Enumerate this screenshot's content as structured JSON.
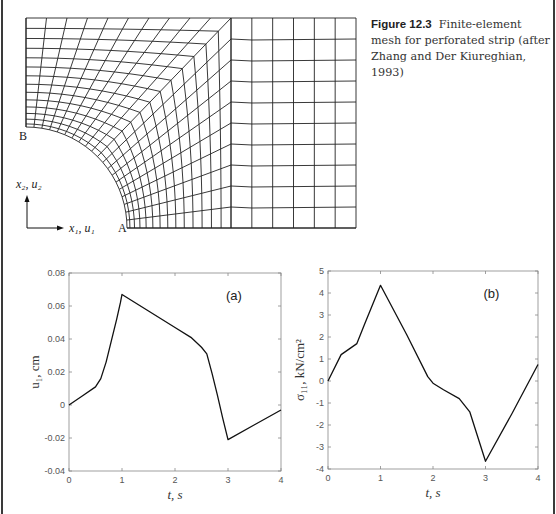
{
  "figure": {
    "label": "Figure 12.3",
    "caption": "Finite-element mesh for perforated strip (after Zhang and Der Kiureghian, 1993)"
  },
  "mesh": {
    "point_b_label": "B",
    "point_a_label": "A",
    "axis_vertical_label": "x₂, u₂",
    "axis_horizontal_label": "x₁, u₁",
    "line_color": "#222222"
  },
  "chart_data": [
    {
      "type": "line",
      "panel_label": "(a)",
      "title": "",
      "xlabel": "t, s",
      "ylabel": "u₁, cm",
      "xlim": [
        0,
        4
      ],
      "ylim": [
        -0.04,
        0.08
      ],
      "xticks": [
        "0",
        "1",
        "2",
        "3",
        "4"
      ],
      "yticks": [
        "-0.04",
        "-0.02",
        "0",
        "0.02",
        "0.04",
        "0.06",
        "0.08"
      ],
      "grid": false,
      "x": [
        0,
        0.25,
        0.5,
        0.6,
        0.7,
        0.8,
        0.9,
        0.97,
        1.0,
        1.5,
        2.0,
        2.3,
        2.5,
        2.6,
        2.7,
        2.8,
        2.9,
        3.0,
        3.5,
        4.0
      ],
      "y": [
        0,
        0.0055,
        0.011,
        0.016,
        0.026,
        0.039,
        0.052,
        0.062,
        0.067,
        0.057,
        0.047,
        0.041,
        0.035,
        0.031,
        0.019,
        0.006,
        -0.008,
        -0.021,
        -0.012,
        -0.003
      ]
    },
    {
      "type": "line",
      "panel_label": "(b)",
      "title": "",
      "xlabel": "t, s",
      "ylabel": "σ₁₁, kN/cm²",
      "xlim": [
        0,
        4
      ],
      "ylim": [
        -4,
        5
      ],
      "xticks": [
        "0",
        "1",
        "2",
        "3",
        "4"
      ],
      "yticks": [
        "-4",
        "-3",
        "-2",
        "-1",
        "0",
        "1",
        "2",
        "3",
        "4",
        "5"
      ],
      "grid": false,
      "x": [
        0,
        0.25,
        0.4,
        0.55,
        0.7,
        1.0,
        1.5,
        1.9,
        2.0,
        2.2,
        2.5,
        2.7,
        3.0,
        3.5,
        4.0
      ],
      "y": [
        0,
        1.2,
        1.45,
        1.7,
        2.6,
        4.35,
        2.1,
        0.2,
        -0.1,
        -0.4,
        -0.8,
        -1.4,
        -3.65,
        -1.5,
        0.75
      ]
    }
  ]
}
